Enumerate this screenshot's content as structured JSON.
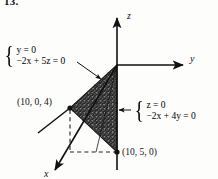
{
  "figure": {
    "problem_number": "13.",
    "axes": {
      "z_label": "z",
      "y_label": "y",
      "x_label": "x"
    },
    "points": [
      {
        "name": "point-10-0-4",
        "label": "(10, 0, 4)"
      },
      {
        "name": "point-10-5-0",
        "label": "(10, 5, 0)"
      }
    ],
    "equations": {
      "left": {
        "line1": "y = 0",
        "line2": "−2x + 5z = 0"
      },
      "right": {
        "line1": "z = 0",
        "line2": "−2x + 4y = 0"
      }
    },
    "colors": {
      "ink": "#111111",
      "shading": "#2a2a2a",
      "paper": "#fdfdfc"
    }
  }
}
